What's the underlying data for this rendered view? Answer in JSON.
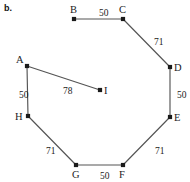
{
  "figure": {
    "part_label": "b.",
    "width": 190,
    "height": 182
  },
  "chart_data": {
    "type": "diagram",
    "title": "b.",
    "nodes": [
      {
        "id": "A",
        "label": "A",
        "x": 27,
        "y": 66,
        "label_dx": -11,
        "label_dy": -11
      },
      {
        "id": "B",
        "label": "B",
        "x": 74,
        "y": 19,
        "label_dx": -4,
        "label_dy": -14
      },
      {
        "id": "C",
        "label": "C",
        "x": 123,
        "y": 19,
        "label_dx": -4,
        "label_dy": -14
      },
      {
        "id": "D",
        "label": "D",
        "x": 170,
        "y": 67,
        "label_dx": 4,
        "label_dy": -4
      },
      {
        "id": "E",
        "label": "E",
        "x": 170,
        "y": 117,
        "label_dx": 4,
        "label_dy": -4
      },
      {
        "id": "F",
        "label": "F",
        "x": 123,
        "y": 165,
        "label_dx": -4,
        "label_dy": 5
      },
      {
        "id": "G",
        "label": "G",
        "x": 76,
        "y": 165,
        "label_dx": -4,
        "label_dy": 5
      },
      {
        "id": "H",
        "label": "H",
        "x": 28,
        "y": 116,
        "label_dx": -13,
        "label_dy": -4
      },
      {
        "id": "I",
        "label": "I",
        "x": 100,
        "y": 90,
        "label_dx": 4,
        "label_dy": -4
      }
    ],
    "edges": [
      {
        "from": "B",
        "to": "C",
        "weight": "50",
        "label_x": 99,
        "label_y": 9
      },
      {
        "from": "C",
        "to": "D",
        "weight": "71",
        "label_x": 154,
        "label_y": 38
      },
      {
        "from": "D",
        "to": "E",
        "weight": "50",
        "label_x": 177,
        "label_y": 91
      },
      {
        "from": "E",
        "to": "F",
        "weight": "71",
        "label_x": 155,
        "label_y": 147
      },
      {
        "from": "F",
        "to": "G",
        "weight": "50",
        "label_x": 100,
        "label_y": 172
      },
      {
        "from": "G",
        "to": "H",
        "weight": "71",
        "label_x": 46,
        "label_y": 147
      },
      {
        "from": "H",
        "to": "A",
        "weight": "50",
        "label_x": 19,
        "label_y": 91
      },
      {
        "from": "A",
        "to": "I",
        "weight": "78",
        "label_x": 63,
        "label_y": 87
      }
    ],
    "colors": {
      "edge": "#545454",
      "node": "#1a1a1a",
      "text": "#1b1b1b",
      "background": "#ffffff"
    }
  }
}
